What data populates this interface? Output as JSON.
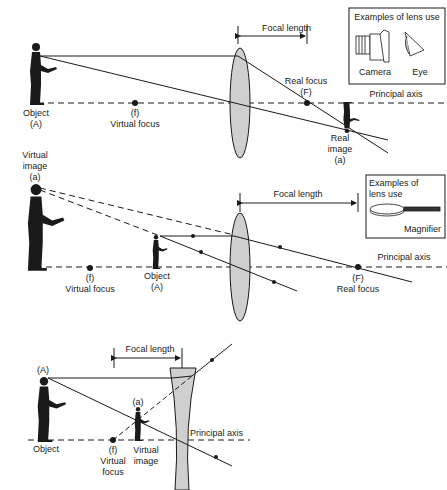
{
  "colors": {
    "ink": "#1a1a1a",
    "lens_fill": "#cfcfcf",
    "background": "#ffffff"
  },
  "diagram_convex_camera": {
    "focal_length_label": "Focal length",
    "object_label": "Object",
    "object_sub": "(A)",
    "virtual_focus_sym": "(f)",
    "virtual_focus_label": "Virtual focus",
    "real_focus_label": "Real focus",
    "real_focus_sym": "(F)",
    "principal_axis_label": "Principal axis",
    "real_image_label_1": "Real",
    "real_image_label_2": "image",
    "real_image_sub": "(a)",
    "examples_box": {
      "title": "Examples of lens use",
      "items": [
        {
          "icon": "camera-icon",
          "label": "Camera"
        },
        {
          "icon": "eye-icon",
          "label": "Eye"
        }
      ]
    }
  },
  "diagram_convex_magnifier": {
    "virtual_image_label_1": "Virtual",
    "virtual_image_label_2": "image",
    "virtual_image_sub": "(a)",
    "focal_length_label": "Focal length",
    "virtual_focus_sym": "(f)",
    "virtual_focus_label": "Virtual focus",
    "object_label": "Object",
    "object_sub": "(A)",
    "real_focus_sym": "(F)",
    "real_focus_label": "Real focus",
    "principal_axis_label": "Principal axis",
    "examples_box": {
      "title_1": "Examples of",
      "title_2": "lens use",
      "items": [
        {
          "icon": "magnifier-icon",
          "label": "Magnifier"
        }
      ]
    }
  },
  "diagram_concave": {
    "focal_length_label": "Focal length",
    "object_sub": "(A)",
    "object_label": "Object",
    "image_sub": "(a)",
    "virtual_focus_sym": "(f)",
    "virtual_focus_label_1": "Virtual",
    "virtual_focus_label_2": "focus",
    "virtual_image_label_1": "Virtual",
    "virtual_image_label_2": "image",
    "principal_axis_label": "Principal axis"
  }
}
